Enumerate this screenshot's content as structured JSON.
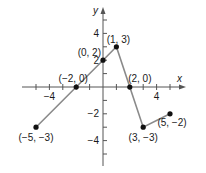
{
  "chart_data": {
    "type": "line",
    "title": "",
    "xlabel": "x",
    "ylabel": "y",
    "xlim": [
      -6,
      6
    ],
    "ylim": [
      -6,
      6
    ],
    "grid": false,
    "x_tick_labels": [
      "-4",
      "4"
    ],
    "y_tick_labels": [
      "4",
      "2",
      "-2",
      "-4"
    ],
    "x": [
      -5,
      -2,
      0,
      1,
      2,
      3,
      5
    ],
    "y": [
      -3,
      0,
      2,
      3,
      0,
      -3,
      -2
    ],
    "point_labels": [
      "(−5, −3)",
      "(−2, 0)",
      "(0, 2)",
      "(1, 3)",
      "(2, 0)",
      "(3, −3)",
      "(5, −2)"
    ],
    "line_color": "#8a8a8a",
    "point_color": "#111111"
  }
}
